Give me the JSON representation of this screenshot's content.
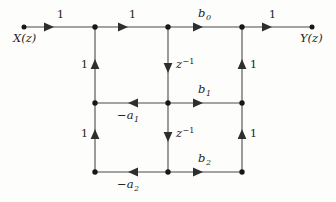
{
  "figure": {
    "kind": "signal-flow-graph",
    "background_color": "#fdfdfc",
    "line_color": "#3a3a3a",
    "node_color": "#1a1a1a",
    "text_color": "#1c1c1c"
  },
  "terminals": {
    "input": {
      "label_base": "X",
      "label_var": "z",
      "x": 24,
      "y": 27
    },
    "output": {
      "label_base": "Y",
      "label_var": "z",
      "x": 312,
      "y": 27
    }
  },
  "nodes": [
    {
      "name": "input-terminal",
      "x": 24,
      "y": 27
    },
    {
      "name": "top-left-node",
      "x": 95,
      "y": 27
    },
    {
      "name": "top-middle-node",
      "x": 168,
      "y": 27
    },
    {
      "name": "top-right-node",
      "x": 242,
      "y": 27
    },
    {
      "name": "output-terminal",
      "x": 312,
      "y": 27
    },
    {
      "name": "middle-left-node",
      "x": 95,
      "y": 103
    },
    {
      "name": "middle-center-node",
      "x": 168,
      "y": 103
    },
    {
      "name": "middle-right-node",
      "x": 242,
      "y": 103
    },
    {
      "name": "bottom-left-node",
      "x": 95,
      "y": 172
    },
    {
      "name": "bottom-center-node",
      "x": 168,
      "y": 172
    },
    {
      "name": "bottom-right-node",
      "x": 242,
      "y": 172
    }
  ],
  "edges": [
    {
      "name": "edge-input-to-top-left",
      "from": [
        24,
        27
      ],
      "to": [
        95,
        27
      ],
      "direction": "right",
      "gain": "1"
    },
    {
      "name": "edge-top-left-to-top-middle",
      "from": [
        95,
        27
      ],
      "to": [
        168,
        27
      ],
      "direction": "right",
      "gain": "1"
    },
    {
      "name": "edge-top-middle-to-top-right",
      "from": [
        168,
        27
      ],
      "to": [
        242,
        27
      ],
      "direction": "right",
      "gain": "b0"
    },
    {
      "name": "edge-top-right-to-output",
      "from": [
        242,
        27
      ],
      "to": [
        312,
        27
      ],
      "direction": "right",
      "gain": "1"
    },
    {
      "name": "edge-delay-top",
      "from": [
        168,
        27
      ],
      "to": [
        168,
        103
      ],
      "direction": "down",
      "gain": "z^-1"
    },
    {
      "name": "edge-delay-bottom",
      "from": [
        168,
        103
      ],
      "to": [
        168,
        172
      ],
      "direction": "down",
      "gain": "z^-1"
    },
    {
      "name": "edge-feedback-a1",
      "from": [
        168,
        103
      ],
      "to": [
        95,
        103
      ],
      "direction": "left",
      "gain": "-a1"
    },
    {
      "name": "edge-feedforward-b1",
      "from": [
        168,
        103
      ],
      "to": [
        242,
        103
      ],
      "direction": "right",
      "gain": "b1"
    },
    {
      "name": "edge-feedback-a2",
      "from": [
        168,
        172
      ],
      "to": [
        95,
        172
      ],
      "direction": "left",
      "gain": "-a2"
    },
    {
      "name": "edge-feedforward-b2",
      "from": [
        168,
        172
      ],
      "to": [
        242,
        172
      ],
      "direction": "right",
      "gain": "b2"
    },
    {
      "name": "edge-left-lower-up",
      "from": [
        95,
        172
      ],
      "to": [
        95,
        103
      ],
      "direction": "up",
      "gain": "1"
    },
    {
      "name": "edge-left-upper-up",
      "from": [
        95,
        103
      ],
      "to": [
        95,
        27
      ],
      "direction": "up",
      "gain": "1"
    },
    {
      "name": "edge-right-lower-up",
      "from": [
        242,
        172
      ],
      "to": [
        242,
        103
      ],
      "direction": "up",
      "gain": "1"
    },
    {
      "name": "edge-right-upper-up",
      "from": [
        242,
        103
      ],
      "to": [
        242,
        27
      ],
      "direction": "up",
      "gain": "1"
    }
  ],
  "labels": {
    "input_base": "X",
    "input_open": "(",
    "input_var": "z",
    "input_close": ")",
    "output_base": "Y",
    "output_open": "(",
    "output_var": "z",
    "output_close": ")",
    "gain_top_1": "1",
    "gain_top_2": "1",
    "gain_top_out": "1",
    "b0_base": "b",
    "b0_sub": "0",
    "b1_base": "b",
    "b1_sub": "1",
    "b2_base": "b",
    "b2_sub": "2",
    "a1_sign": "−a",
    "a1_sub": "1",
    "a2_sign": "−a",
    "a2_sub": "2",
    "delay_base": "z",
    "delay_exp": "−1",
    "gain_left_upper": "1",
    "gain_left_lower": "1",
    "gain_right_upper": "1",
    "gain_right_lower": "1"
  }
}
